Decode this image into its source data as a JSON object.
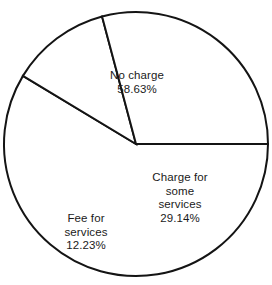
{
  "chart_data": {
    "type": "pie",
    "title": "",
    "subtitle": "",
    "xlabel": "",
    "ylabel": "",
    "legend_position": "none",
    "grid": false,
    "units": "percent",
    "total": 100.0,
    "start_angle_deg": 0,
    "direction": "clockwise",
    "categories": [
      "No charge",
      "Fee for services",
      "Charge for some services"
    ],
    "values": [
      58.63,
      12.23,
      29.14
    ],
    "slices": [
      {
        "label": "No charge",
        "label_lines": [
          "No charge"
        ],
        "value": 58.63,
        "value_text": "58.63%",
        "angle_deg": 211.07,
        "start_deg": 0,
        "end_deg": 211.07,
        "fill": "#ffffff",
        "stroke": "#141414",
        "label_x": 137,
        "label_y": 82
      },
      {
        "label": "Fee for services",
        "label_lines": [
          "Fee for",
          "services"
        ],
        "value": 12.23,
        "value_text": "12.23%",
        "angle_deg": 44.03,
        "start_deg": 211.07,
        "end_deg": 255.1,
        "fill": "#ffffff",
        "stroke": "#141414",
        "label_x": 86,
        "label_y": 232
      },
      {
        "label": "Charge for some services",
        "label_lines": [
          "Charge for",
          "some",
          "services"
        ],
        "value": 29.14,
        "value_text": "29.14%",
        "angle_deg": 104.9,
        "start_deg": 255.1,
        "end_deg": 360,
        "fill": "#ffffff",
        "stroke": "#141414",
        "label_x": 180,
        "label_y": 198
      }
    ],
    "geometry": {
      "center_x": 136,
      "center_y": 144,
      "radius": 132,
      "stroke_width": 2
    },
    "colors": {
      "background": "#ffffff",
      "outline": "#141414",
      "text": "#1a1a1a"
    }
  }
}
